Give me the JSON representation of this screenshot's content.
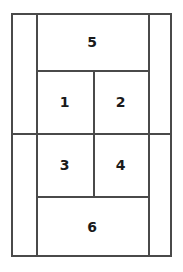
{
  "diagram": {
    "type": "partitioned-rectangle-layout",
    "canvas": {
      "width": 183,
      "height": 272,
      "background": "#ffffff"
    },
    "stroke": {
      "color": "#4a4a4a",
      "width": 2
    },
    "label_color": "#1a1a1a",
    "frame": {
      "x": 11,
      "y": 13,
      "width": 161,
      "height": 244
    },
    "regions": [
      {
        "id": "region-1",
        "label": "1",
        "x": 36,
        "y": 70,
        "width": 57,
        "height": 63
      },
      {
        "id": "region-2",
        "label": "2",
        "x": 93,
        "y": 70,
        "width": 55,
        "height": 63
      },
      {
        "id": "region-3",
        "label": "3",
        "x": 36,
        "y": 133,
        "width": 57,
        "height": 63
      },
      {
        "id": "region-4",
        "label": "4",
        "x": 93,
        "y": 133,
        "width": 55,
        "height": 63
      },
      {
        "id": "region-5",
        "label": "5",
        "x": 36,
        "y": 13,
        "width": 112,
        "height": 57
      },
      {
        "id": "region-6",
        "label": "6",
        "x": 36,
        "y": 196,
        "width": 112,
        "height": 61
      },
      {
        "id": "region-left-margin",
        "label": "",
        "x": 11,
        "y": 13,
        "width": 25,
        "height": 244
      },
      {
        "id": "region-right-margin",
        "label": "",
        "x": 148,
        "y": 13,
        "width": 24,
        "height": 244
      }
    ],
    "vertical_rules": [
      {
        "id": "v-rule-left",
        "x": 36,
        "y1": 13,
        "y2": 257
      },
      {
        "id": "v-rule-center",
        "x": 93,
        "y1": 70,
        "y2": 196
      },
      {
        "id": "v-rule-right",
        "x": 148,
        "y1": 13,
        "y2": 257
      }
    ],
    "horizontal_rules": [
      {
        "id": "h-rule-top",
        "y": 70,
        "x1": 36,
        "x2": 148
      },
      {
        "id": "h-rule-middle",
        "y": 133,
        "x1": 11,
        "x2": 172
      },
      {
        "id": "h-rule-bottom",
        "y": 196,
        "x1": 36,
        "x2": 148
      }
    ]
  }
}
